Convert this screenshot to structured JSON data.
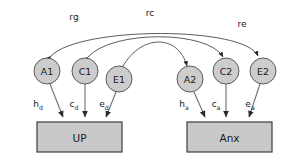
{
  "diagram": {
    "background_color": "#ffffff",
    "latent_fill": "#cccccc",
    "observed_fill": "#c9c9c9",
    "line_color": "#4a4a4a",
    "latent_variables": [
      {
        "id": "A1",
        "label": "A1",
        "cx": 47,
        "cy": 71,
        "r": 13
      },
      {
        "id": "C1",
        "label": "C1",
        "cx": 85,
        "cy": 71,
        "r": 13
      },
      {
        "id": "E1",
        "label": "E1",
        "cx": 119,
        "cy": 79,
        "r": 13
      },
      {
        "id": "A2",
        "label": "A2",
        "cx": 190,
        "cy": 79,
        "r": 13
      },
      {
        "id": "C2",
        "label": "C2",
        "cx": 226,
        "cy": 71,
        "r": 13
      },
      {
        "id": "E2",
        "label": "E2",
        "cx": 263,
        "cy": 71,
        "r": 13
      }
    ],
    "observed_variables": [
      {
        "id": "UP",
        "label": "UP",
        "x": 37,
        "y": 122,
        "width": 85,
        "height": 30
      },
      {
        "id": "Anx",
        "label": "Anx",
        "x": 187,
        "y": 122,
        "width": 85,
        "height": 30
      }
    ],
    "correlation_arcs": [
      {
        "id": "rg",
        "label": "rg",
        "from": "A1",
        "to": "A2",
        "label_x": 74,
        "label_y": 17
      },
      {
        "id": "rc",
        "label": "rc",
        "from": "C1",
        "to": "C2",
        "label_x": 150,
        "label_y": 13
      },
      {
        "id": "re",
        "label": "re",
        "from": "E1",
        "to": "E2",
        "label_x": 242,
        "label_y": 24
      }
    ],
    "path_coefficients": [
      {
        "id": "hd",
        "base": "h",
        "sub": "d",
        "from": "A1",
        "to": "UP",
        "label_x": 38,
        "label_y": 104
      },
      {
        "id": "cd",
        "base": "c",
        "sub": "d",
        "from": "C1",
        "to": "UP",
        "label_x": 74,
        "label_y": 104
      },
      {
        "id": "ed",
        "base": "e",
        "sub": "d",
        "from": "E1",
        "to": "UP",
        "label_x": 104,
        "label_y": 104
      },
      {
        "id": "ha",
        "base": "h",
        "sub": "a",
        "from": "A2",
        "to": "Anx",
        "label_x": 184,
        "label_y": 104
      },
      {
        "id": "ca",
        "base": "c",
        "sub": "a",
        "from": "C2",
        "to": "Anx",
        "label_x": 216,
        "label_y": 104
      },
      {
        "id": "ea",
        "base": "e",
        "sub": "a",
        "from": "E2",
        "to": "Anx",
        "label_x": 250,
        "label_y": 104
      }
    ]
  }
}
